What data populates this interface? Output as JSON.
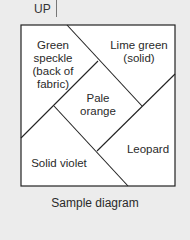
{
  "header": {
    "up_label": "UP"
  },
  "diagram": {
    "regions": [
      {
        "id": "top-left",
        "label_lines": [
          "Green",
          "speckle",
          "(back of",
          "fabric)"
        ]
      },
      {
        "id": "top-right",
        "label_lines": [
          "Lime green",
          "(solid)"
        ]
      },
      {
        "id": "center",
        "label_lines": [
          "Pale",
          "orange"
        ]
      },
      {
        "id": "bottom-right",
        "label_lines": [
          "Leopard"
        ]
      },
      {
        "id": "bottom-left",
        "label_lines": [
          "Solid violet"
        ]
      }
    ],
    "labels": {
      "top_left": "Green speckle (back of fabric)",
      "top_right": "Lime green (solid)",
      "center": "Pale orange",
      "bottom_right": "Leopard",
      "bottom_left": "Solid violet"
    },
    "line_color": "#222222",
    "fill_color": "#ffffff"
  },
  "caption": "Sample diagram"
}
